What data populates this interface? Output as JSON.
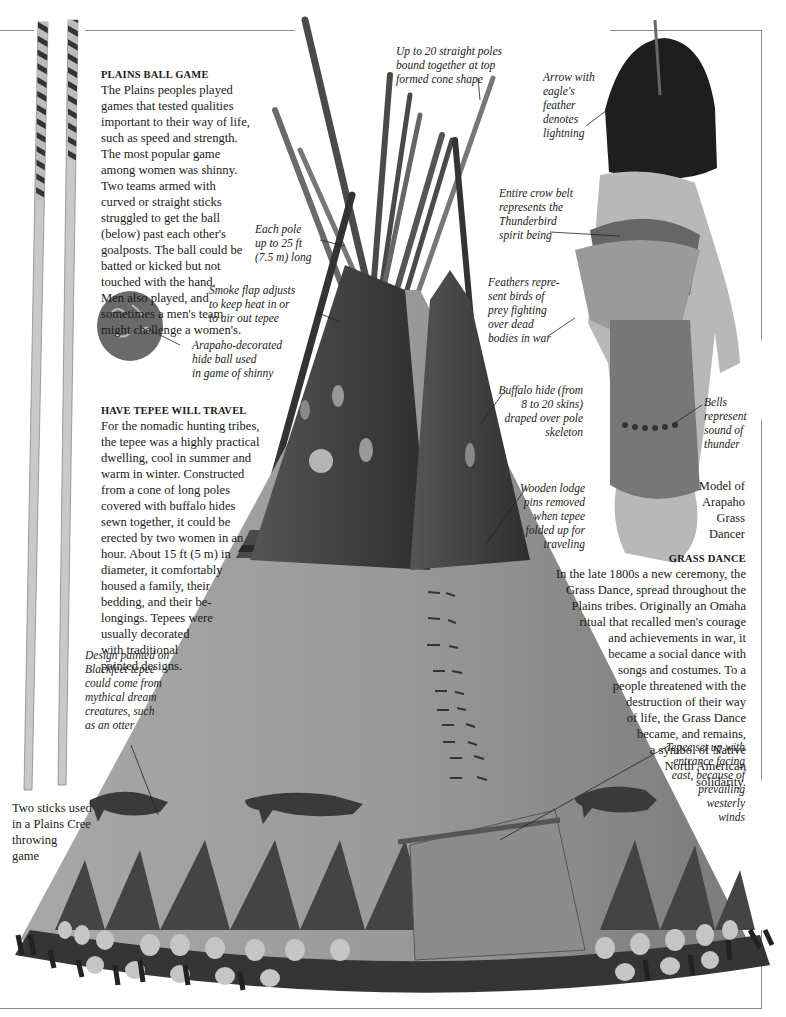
{
  "page": {
    "colors": {
      "frame": "#8a8a8a",
      "text": "#1a1a1a",
      "tepee_light": "#9a9a9a",
      "tepee_dark": "#3a3a3a",
      "pole": "#4a4a4a"
    }
  },
  "plains_ball_game": {
    "heading": "PLAINS BALL GAME",
    "lines": [
      "The Plains peoples played",
      "games that tested qualities",
      "important to their way of life,",
      "such as speed and strength.",
      "The most popular game",
      "among women was shinny.",
      "Two teams armed with",
      "curved or straight sticks",
      "struggled to get the ball",
      "(below) past each other's",
      "goalposts. The ball could be",
      "batted or kicked but not",
      "touched with the hand.",
      "Men also played, and",
      "sometimes a men's team",
      "might challenge a women's."
    ]
  },
  "have_tepee": {
    "heading": "HAVE TEPEE WILL TRAVEL",
    "lines": [
      "For the nomadic hunting tribes,",
      "the tepee was a highly practical",
      "dwelling, cool in summer and",
      "warm in winter. Constructed",
      "from a cone of long poles",
      "covered with buffalo hides",
      "sewn together, it could be",
      "erected by two women in an",
      "hour. About 15 ft (5 m) in",
      "diameter, it comfortably",
      "housed a family, their",
      "bedding, and their be-",
      "longings. Tepees were",
      "usually decorated",
      "with traditional",
      "painted designs."
    ]
  },
  "grass_dance": {
    "heading": "GRASS DANCE",
    "lines": [
      "In the late 1800s a new ceremony, the",
      "Grass Dance, spread throughout the",
      "Plains tribes. Originally an Omaha",
      "ritual that recalled men's courage",
      "and achievements in war, it",
      "became a social dance with",
      "songs and costumes. To a",
      "people threatened with the",
      "destruction of their way",
      "of life, the Grass Dance",
      "became, and remains,",
      "a symbol of Native",
      "North American",
      "solidarity."
    ]
  },
  "captions": {
    "poles_bound": [
      "Up to 20 straight poles",
      "bound together at top",
      "formed cone shape"
    ],
    "each_pole": [
      "Each pole",
      "up to 25 ft",
      "(7.5 m) long"
    ],
    "smoke_flap": [
      "Smoke flap adjusts",
      "to keep heat in or",
      "to air out tepee"
    ],
    "hide_ball": [
      "Arapaho-decorated",
      "hide ball used",
      "in game of shinny"
    ],
    "arrow": [
      "Arrow with",
      "eagle's",
      "feather",
      "denotes",
      "lightning"
    ],
    "crow_belt": [
      "Entire crow belt",
      "represents the",
      "Thunderbird",
      "spirit being"
    ],
    "feathers": [
      "Feathers repre-",
      "sent birds of",
      "prey fighting",
      "over dead",
      "bodies in war"
    ],
    "buffalo_hide": [
      "Buffalo hide (from",
      "8 to 20 skins)",
      "draped over pole",
      "skeleton"
    ],
    "bells": [
      "Bells",
      "represent",
      "sound of",
      "thunder"
    ],
    "lodge_pins": [
      "Wooden lodge",
      "pins removed",
      "when tepee",
      "folded up for",
      "traveling"
    ],
    "model": [
      "Model of",
      "Arapaho",
      "Grass",
      "Dancer"
    ],
    "blackfeet": [
      "Design painted on",
      "Blackfeet tepee",
      "could come from",
      "mythical dream",
      "creatures, such",
      "as an otter"
    ],
    "entrance": [
      "Tepee set up with",
      "entrance facing",
      "east, because of",
      "prevailing",
      "westerly",
      "winds"
    ],
    "sticks": [
      "Two sticks used",
      "in a Plains Cree",
      "throwing",
      "game"
    ]
  },
  "icons": {
    "tepee": "tepee-illustration",
    "dancer": "grass-dancer-figure",
    "ball": "hide-ball",
    "sticks": "throwing-sticks"
  }
}
